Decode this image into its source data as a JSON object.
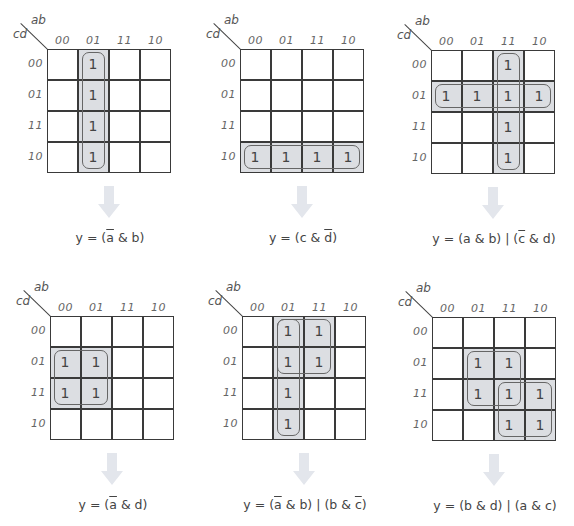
{
  "axis_labels": {
    "column_var": "ab",
    "row_var": "cd"
  },
  "column_codes": [
    "00",
    "01",
    "11",
    "10"
  ],
  "row_codes": [
    "00",
    "01",
    "11",
    "10"
  ],
  "cell_value": "1",
  "colors": {
    "grid_line": "#3a3a3a",
    "shade": "#dcdee2",
    "loop_border": "#666666",
    "arrow": "#e3e6ec",
    "text": "#444444"
  },
  "maps": [
    {
      "id": "map-1",
      "ones": [
        [
          0,
          1
        ],
        [
          1,
          1
        ],
        [
          2,
          1
        ],
        [
          3,
          1
        ]
      ],
      "groups": [
        {
          "rows": [
            0,
            3
          ],
          "cols": [
            1,
            1
          ]
        }
      ],
      "formula": {
        "prefix": "y = (",
        "parts": [
          {
            "t": "a",
            "bar": true
          },
          {
            "t": " & b)",
            "bar": false
          }
        ]
      },
      "formula_text": "y = (ā & b)"
    },
    {
      "id": "map-2",
      "ones": [
        [
          3,
          0
        ],
        [
          3,
          1
        ],
        [
          3,
          2
        ],
        [
          3,
          3
        ]
      ],
      "groups": [
        {
          "rows": [
            3,
            3
          ],
          "cols": [
            0,
            3
          ]
        }
      ],
      "formula_text": "y = (c & d̄)"
    },
    {
      "id": "map-3",
      "ones": [
        [
          0,
          2
        ],
        [
          1,
          0
        ],
        [
          1,
          1
        ],
        [
          1,
          2
        ],
        [
          1,
          3
        ],
        [
          2,
          2
        ],
        [
          3,
          2
        ]
      ],
      "groups": [
        {
          "rows": [
            0,
            3
          ],
          "cols": [
            2,
            2
          ]
        },
        {
          "rows": [
            1,
            1
          ],
          "cols": [
            0,
            3
          ]
        }
      ],
      "formula_text": "y = (a & b) | (c̄ & d)"
    },
    {
      "id": "map-4",
      "ones": [
        [
          1,
          0
        ],
        [
          1,
          1
        ],
        [
          2,
          0
        ],
        [
          2,
          1
        ]
      ],
      "groups": [
        {
          "rows": [
            1,
            2
          ],
          "cols": [
            0,
            1
          ]
        }
      ],
      "formula_text": "y = (ā & d)"
    },
    {
      "id": "map-5",
      "ones": [
        [
          0,
          1
        ],
        [
          0,
          2
        ],
        [
          1,
          1
        ],
        [
          1,
          2
        ],
        [
          2,
          1
        ],
        [
          3,
          1
        ]
      ],
      "groups": [
        {
          "rows": [
            0,
            3
          ],
          "cols": [
            1,
            1
          ]
        },
        {
          "rows": [
            0,
            1
          ],
          "cols": [
            1,
            2
          ]
        }
      ],
      "formula_text": "y = (ā & b) | (b & c̄)"
    },
    {
      "id": "map-6",
      "ones": [
        [
          1,
          1
        ],
        [
          1,
          2
        ],
        [
          2,
          1
        ],
        [
          2,
          2
        ],
        [
          2,
          3
        ],
        [
          3,
          2
        ],
        [
          3,
          3
        ]
      ],
      "groups": [
        {
          "rows": [
            1,
            2
          ],
          "cols": [
            1,
            2
          ]
        },
        {
          "rows": [
            2,
            3
          ],
          "cols": [
            2,
            3
          ]
        }
      ],
      "formula_text": "y = (b & d) | (a & c)"
    }
  ],
  "formulas": {
    "f1": {
      "a": "y = (",
      "b": "a",
      "c": " & b)"
    },
    "f2": {
      "a": "y = (c & ",
      "b": "d",
      "c": ")"
    },
    "f3": {
      "a": "y = (a & b) | (",
      "b": "c",
      "c": " & d)"
    },
    "f4": {
      "a": "y = (",
      "b": "a",
      "c": " & d)"
    },
    "f5": {
      "a": "y = (",
      "b": "a",
      "c": " & b) | (b & ",
      "d": "c",
      "e": ")"
    },
    "f6": {
      "a": "y = (b & d) | (a & c)"
    }
  }
}
